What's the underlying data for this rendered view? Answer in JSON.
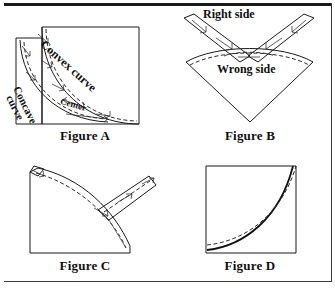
{
  "page": {
    "background_color": "#ffffff",
    "ink_color": "#1a1a1a"
  },
  "figures": [
    {
      "id": "figure-a",
      "caption": "Figure A",
      "description": "Square pattern piece with convex and concave curved edges pinned together at center",
      "labels": [
        {
          "name": "convex-curve-label",
          "text": "Convex curve",
          "rotation_deg": 42
        },
        {
          "name": "concave-curve-label-line1",
          "text": "Concave",
          "rotation_deg": 64
        },
        {
          "name": "concave-curve-label-line2",
          "text": "curve",
          "rotation_deg": 64
        },
        {
          "name": "center-label",
          "text": "Center",
          "rotation_deg": 16
        }
      ]
    },
    {
      "id": "figure-b",
      "caption": "Figure B",
      "description": "Kite shaped piece with two upward arms pinned at the curved seam",
      "labels": [
        {
          "name": "right-side-label",
          "text": "Right side",
          "rotation_deg": 0
        },
        {
          "name": "wrong-side-label",
          "text": "Wrong side",
          "rotation_deg": 0
        }
      ]
    },
    {
      "id": "figure-c",
      "caption": "Figure C",
      "description": "Quarter circle piece with angled extension arm pinned along the curve",
      "labels": []
    },
    {
      "id": "figure-d",
      "caption": "Figure D",
      "description": "Square block with finished curved seam line stitched",
      "labels": []
    }
  ],
  "captions": {
    "a": "Figure A",
    "b": "Figure B",
    "c": "Figure C",
    "d": "Figure D"
  },
  "annotations": {
    "convex_curve": "Convex curve",
    "concave_curve_line1": "Concave",
    "concave_curve_line2": "curve",
    "center": "Center",
    "right_side": "Right side",
    "wrong_side": "Wrong side"
  }
}
